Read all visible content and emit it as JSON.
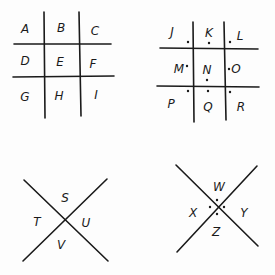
{
  "grid_plain": {
    "letters": [
      "A",
      "B",
      "C",
      "D",
      "E",
      "F",
      "G",
      "H",
      "I"
    ]
  },
  "grid_dotted": {
    "letters": [
      "J",
      "K",
      "L",
      "M",
      "N",
      "O",
      "P",
      "Q",
      "R"
    ]
  },
  "x_plain": {
    "letters": [
      "S",
      "T",
      "U",
      "V"
    ]
  },
  "x_dotted": {
    "letters": [
      "W",
      "X",
      "Y",
      "Z"
    ]
  }
}
